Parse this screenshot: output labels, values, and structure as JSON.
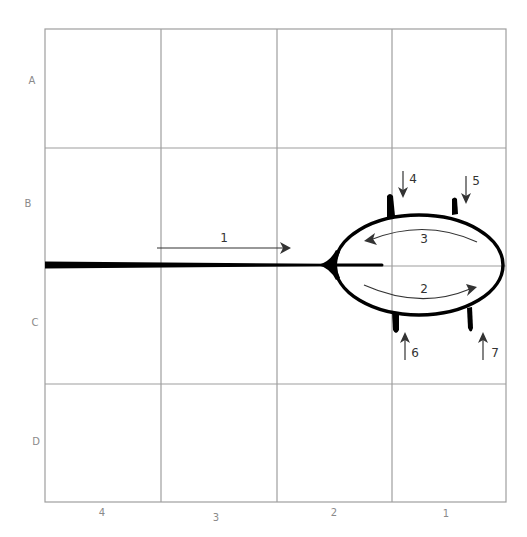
{
  "diagram": {
    "type": "grid-map-with-loop-and-flow-arrows",
    "row_labels": [
      "A",
      "B",
      "C",
      "D"
    ],
    "column_labels": [
      "4",
      "3",
      "2",
      "1"
    ],
    "arrow_labels": {
      "a1": "1",
      "a2": "2",
      "a3": "3",
      "a4": "4",
      "a5": "5",
      "a6": "6",
      "a7": "7"
    },
    "colors": {
      "grid": "#9e9e9e",
      "vessel": "#000000",
      "arrow": "#333333",
      "axis_label": "#8a8a8a"
    }
  }
}
